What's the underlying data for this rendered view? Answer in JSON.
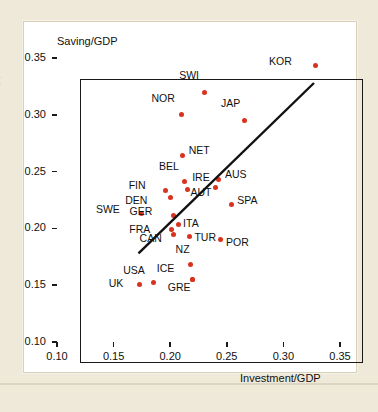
{
  "figure": {
    "edge_glyph": "t",
    "background_color": "#efe9da",
    "panel_color": "#ffffff",
    "point_color": "#d9321e",
    "line_color": "#111111"
  },
  "chart_data": {
    "type": "scatter",
    "title": "",
    "xlabel": "Investment/GDP",
    "ylabel": "Saving/GDP",
    "xlim": [
      0.1,
      0.35
    ],
    "ylim": [
      0.1,
      0.35
    ],
    "xticks": [
      "0.10",
      "0.15",
      "0.20",
      "0.25",
      "0.30",
      "0.35"
    ],
    "yticks": [
      "0.35",
      "0.30",
      "0.25",
      "0.20",
      "0.15",
      "0.10"
    ],
    "xtick_values": [
      0.1,
      0.15,
      0.2,
      0.25,
      0.3,
      0.35
    ],
    "ytick_values": [
      0.35,
      0.3,
      0.25,
      0.2,
      0.15,
      0.1
    ],
    "grid": false,
    "legend": "none",
    "points": [
      {
        "label": "KOR",
        "x": 0.328,
        "y": 0.343,
        "lab_dx": -27,
        "lab_dy": -5
      },
      {
        "label": "SWI",
        "x": 0.23,
        "y": 0.32,
        "lab_dx": -9,
        "lab_dy": -17
      },
      {
        "label": "NOR",
        "x": 0.21,
        "y": 0.3,
        "lab_dx": -11,
        "lab_dy": -17
      },
      {
        "label": "JAP",
        "x": 0.266,
        "y": 0.295,
        "lab_dx": -9,
        "lab_dy": -17
      },
      {
        "label": "NET",
        "x": 0.211,
        "y": 0.264,
        "lab_dx": 6,
        "lab_dy": -6
      },
      {
        "label": "BEL",
        "x": 0.213,
        "y": 0.241,
        "lab_dx": -10,
        "lab_dy": -16
      },
      {
        "label": "AUS",
        "x": 0.243,
        "y": 0.243,
        "lab_dx": 6,
        "lab_dy": -6
      },
      {
        "label": "IRE",
        "x": 0.215,
        "y": 0.234,
        "lab_dx": 5,
        "lab_dy": -13
      },
      {
        "label": "AUT",
        "x": 0.24,
        "y": 0.236,
        "lab_dx": -8,
        "lab_dy": 4
      },
      {
        "label": "FIN",
        "x": 0.196,
        "y": 0.233,
        "lab_dx": -24,
        "lab_dy": -6
      },
      {
        "label": "DEN",
        "x": 0.2,
        "y": 0.227,
        "lab_dx": -27,
        "lab_dy": 2
      },
      {
        "label": "SPA",
        "x": 0.254,
        "y": 0.221,
        "lab_dx": 6,
        "lab_dy": -5
      },
      {
        "label": "SWE",
        "x": 0.175,
        "y": 0.213,
        "lab_dx": -26,
        "lab_dy": -5
      },
      {
        "label": "GER",
        "x": 0.203,
        "y": 0.211,
        "lab_dx": -25,
        "lab_dy": -5
      },
      {
        "label": "ITA",
        "x": 0.207,
        "y": 0.203,
        "lab_dx": 5,
        "lab_dy": -2
      },
      {
        "label": "FRA",
        "x": 0.201,
        "y": 0.199,
        "lab_dx": -25,
        "lab_dy": -1
      },
      {
        "label": "CAN",
        "x": 0.203,
        "y": 0.195,
        "lab_dx": -16,
        "lab_dy": 4
      },
      {
        "label": "TUR",
        "x": 0.217,
        "y": 0.193,
        "lab_dx": 5,
        "lab_dy": 1
      },
      {
        "label": "POR",
        "x": 0.244,
        "y": 0.19,
        "lab_dx": 6,
        "lab_dy": 2
      },
      {
        "label": "NZ",
        "x": 0.218,
        "y": 0.168,
        "lab_dx": -5,
        "lab_dy": -16
      },
      {
        "label": "ICE",
        "x": 0.22,
        "y": 0.155,
        "lab_dx": -22,
        "lab_dy": -12
      },
      {
        "label": "GRE",
        "x": 0.22,
        "y": 0.155,
        "lab_dx": -6,
        "lab_dy": 7
      },
      {
        "label": "USA",
        "x": 0.185,
        "y": 0.152,
        "lab_dx": -12,
        "lab_dy": -13
      },
      {
        "label": "UK",
        "x": 0.173,
        "y": 0.151,
        "lab_dx": -20,
        "lab_dy": -1
      }
    ],
    "fit_line": {
      "x0": 0.172,
      "y0": 0.178,
      "x1": 0.327,
      "y1": 0.328
    }
  }
}
